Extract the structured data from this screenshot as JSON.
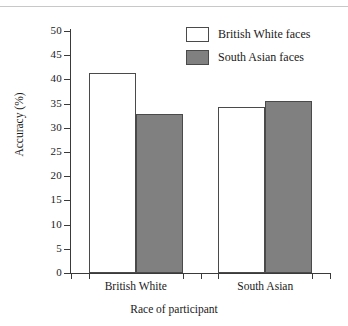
{
  "chart_data": {
    "type": "bar",
    "title": "",
    "xlabel": "Race of participant",
    "ylabel": "Accuracy (%)",
    "categories": [
      "British White",
      "South Asian"
    ],
    "series": [
      {
        "name": "British White faces",
        "values": [
          41.3,
          34.4
        ],
        "color": "#ffffff"
      },
      {
        "name": "South Asian faces",
        "values": [
          32.9,
          35.5
        ],
        "color": "#808080"
      }
    ],
    "ylim": [
      0,
      50
    ],
    "ytick_values": [
      0,
      5,
      10,
      15,
      20,
      25,
      30,
      35,
      40,
      45,
      50
    ],
    "ytick_labels": [
      "0",
      "5",
      "10",
      "15",
      "20",
      "25",
      "30",
      "35",
      "40",
      "45",
      "50"
    ],
    "grid": false,
    "legend_position": "top-right",
    "bar_border_color": "#4a4a4a",
    "axis_color": "#3a3a3a"
  },
  "legend": {
    "items": [
      {
        "label": "British White faces",
        "swatch": "white-swatch"
      },
      {
        "label": "South Asian faces",
        "swatch": "gray-swatch"
      }
    ]
  },
  "axes": {
    "x_title": "Race of participant",
    "y_title": "Accuracy (%)",
    "x_groups": [
      "British White",
      "South Asian"
    ]
  }
}
